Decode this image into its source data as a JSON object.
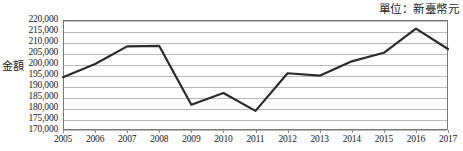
{
  "header": {
    "unit_note": "單位：新臺幣元"
  },
  "chart_data": {
    "type": "line",
    "title": "",
    "subtitle": "",
    "xlabel": "",
    "ylabel": "金額",
    "unit_note": "單位：新臺幣元",
    "categories": [
      "2005",
      "2006",
      "2007",
      "2008",
      "2009",
      "2010",
      "2011",
      "2012",
      "2013",
      "2014",
      "2015",
      "2016",
      "2017"
    ],
    "x": [
      2005,
      2006,
      2007,
      2008,
      2009,
      2010,
      2011,
      2012,
      2013,
      2014,
      2015,
      2016,
      2017
    ],
    "values": [
      194000,
      200000,
      208000,
      208200,
      181500,
      186800,
      178700,
      195800,
      194700,
      201200,
      205100,
      216100,
      206800
    ],
    "series": [
      {
        "name": "金額",
        "values": [
          194000,
          200000,
          208000,
          208200,
          181500,
          186800,
          178700,
          195800,
          194700,
          201200,
          205100,
          216100,
          206800
        ]
      }
    ],
    "ylim": [
      170000,
      220000
    ],
    "ytick_step": 5000,
    "ytick_labels": [
      "220,000",
      "215,000",
      "210,000",
      "205,000",
      "200,000",
      "195,000",
      "190,000",
      "185,000",
      "180,000",
      "175,000",
      "170,000"
    ],
    "ytick_values": [
      220000,
      215000,
      210000,
      205000,
      200000,
      195000,
      190000,
      185000,
      180000,
      175000,
      170000
    ],
    "grid": true,
    "legend": "none",
    "line_color": "#2b2b2b",
    "grid_color": "#b9b9b9",
    "frame_color": "#7a7a7a",
    "background": "#ffffff"
  }
}
